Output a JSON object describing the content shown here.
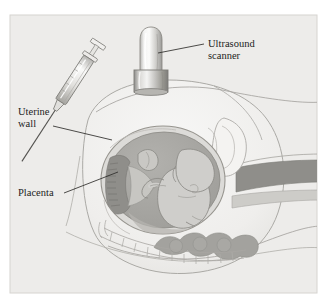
{
  "figure": {
    "panel": {
      "background_color": "#edecea",
      "border_color": "#cfcdc9",
      "x": 10,
      "y": 15,
      "width": 307,
      "height": 278
    },
    "page_background": "#ffffff",
    "line_color": "#9a9894",
    "label_color": "#1c1c1c",
    "palette": {
      "skin_fill": "#f2f1ef",
      "uterus_wall": "#d9d8d5",
      "amniotic_fluid": "#a8a7a3",
      "fetus_fill": "#cfcecb",
      "placenta_fill": "#8f8e8a",
      "spine_band": "#8f8e8a",
      "bowel_fill": "#a3a29e",
      "metal_light": "#f6f6f5",
      "metal_mid": "#c9c8c5",
      "metal_dark": "#8e8d8a"
    }
  },
  "labels": [
    {
      "id": "ultrasound-scanner",
      "name": "label-ultrasound-scanner",
      "line1": "Ultrasound",
      "line2": "scanner",
      "text_x": 208,
      "text_y": 47,
      "leader": {
        "x1": 204,
        "y1": 44,
        "x2": 158,
        "y2": 53
      }
    },
    {
      "id": "uterine-wall",
      "name": "label-uterine-wall",
      "line1": "Uterine",
      "line2": "wall",
      "text_x": 18,
      "text_y": 115,
      "leader": {
        "x1": 53,
        "y1": 126,
        "x2": 112,
        "y2": 140
      }
    },
    {
      "id": "placenta",
      "name": "label-placenta",
      "line1": "Placenta",
      "line2": "",
      "text_x": 18,
      "text_y": 196,
      "leader": {
        "x1": 64,
        "y1": 193,
        "x2": 118,
        "y2": 172
      }
    }
  ],
  "anatomy": {
    "abdomen": "maternal abdomen in sagittal cross-section",
    "uterus": "gravid uterus containing fetus",
    "fetus": "fetus in cephalic flexed position",
    "placenta": "placenta along anterior-left uterine wall",
    "amniotic_sac": "amniotic fluid cavity",
    "spine": "maternal vertebral column",
    "bowel": "maternal bowel loops",
    "bladder_region": "lower abdominal soft tissue"
  },
  "instruments": {
    "syringe": {
      "name": "amniocentesis syringe with needle",
      "angle_degrees": 33,
      "plunger_top_x": 50,
      "plunger_top_y": 45,
      "needle_tip_x": 133,
      "needle_tip_y": 146
    },
    "scanner": {
      "name": "ultrasound transducer probe",
      "body_x": 140,
      "body_y": 28,
      "body_width": 22,
      "body_height": 44,
      "collar_x": 134,
      "collar_y": 70,
      "collar_width": 34,
      "collar_height": 22
    }
  }
}
